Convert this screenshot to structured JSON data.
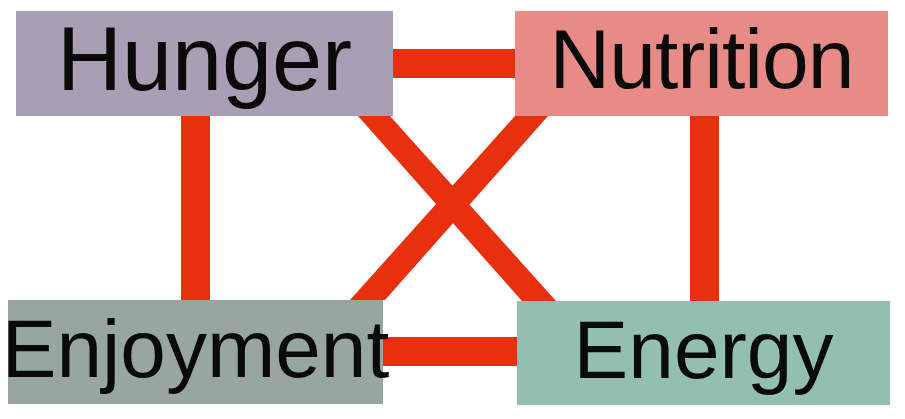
{
  "diagram": {
    "type": "relationship-network",
    "nodes": [
      {
        "id": "hunger",
        "label": "Hunger",
        "color": "#a99fb5",
        "position": "top-left"
      },
      {
        "id": "nutrition",
        "label": "Nutrition",
        "color": "#e88a85",
        "position": "top-right"
      },
      {
        "id": "enjoyment",
        "label": "Enjoyment",
        "color": "#97a79f",
        "position": "bottom-left"
      },
      {
        "id": "energy",
        "label": "Energy",
        "color": "#92bfb0",
        "position": "bottom-right"
      }
    ],
    "edges": [
      {
        "from": "hunger",
        "to": "nutrition"
      },
      {
        "from": "hunger",
        "to": "enjoyment"
      },
      {
        "from": "hunger",
        "to": "energy"
      },
      {
        "from": "nutrition",
        "to": "enjoyment"
      },
      {
        "from": "nutrition",
        "to": "energy"
      },
      {
        "from": "enjoyment",
        "to": "energy"
      }
    ],
    "edge_color": "#e8300f",
    "text_color": "#0a0a0a"
  }
}
